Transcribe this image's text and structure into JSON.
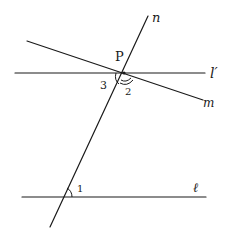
{
  "diagram": {
    "type": "geometry-transversal",
    "lines": {
      "n": {
        "label": "n",
        "from": [
          148,
          16
        ],
        "to": [
          50,
          227
        ]
      },
      "l_prime": {
        "label": "l′",
        "from": [
          15,
          73
        ],
        "to": [
          205,
          73
        ]
      },
      "m": {
        "label": "m",
        "from": [
          27,
          41
        ],
        "to": [
          203,
          100
        ]
      },
      "l": {
        "label": "ℓ",
        "from": [
          22,
          197
        ],
        "to": [
          206,
          197
        ]
      }
    },
    "points": {
      "P": {
        "label": "P",
        "at": [
          124,
          73
        ]
      }
    },
    "angles": {
      "angle_1": {
        "label": "1"
      },
      "angle_2": {
        "label": "2"
      },
      "angle_3": {
        "label": "3"
      }
    },
    "stroke_color": "#1a1a1a",
    "background": "#ffffff"
  }
}
